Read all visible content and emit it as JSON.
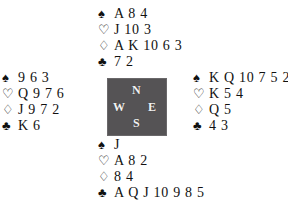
{
  "diagram": {
    "type": "bridge-deal-diagram",
    "background_color": "#ffffff",
    "text_color": "#111111"
  },
  "suits": {
    "spade": {
      "name": "spade-suit-symbol",
      "glyph": "♠",
      "filled": true
    },
    "heart": {
      "name": "heart-suit-symbol",
      "glyph": "♡",
      "filled": false
    },
    "diamond": {
      "name": "diamond-suit-symbol",
      "glyph": "♢",
      "filled": false
    },
    "club": {
      "name": "club-suit-symbol",
      "glyph": "♣",
      "filled": true
    }
  },
  "compass": {
    "box_color": "#555355",
    "label_color": "#f2f2f2",
    "north": "N",
    "west": "W",
    "east": "E",
    "south": "S"
  },
  "hands": {
    "north": {
      "position": "North",
      "spades": "A 8 4",
      "hearts": "J 10 3",
      "diamonds": "A K 10 6 3",
      "clubs": "7 2"
    },
    "west": {
      "position": "West",
      "spades": "9 6 3",
      "hearts": "Q 9 7 6",
      "diamonds": "J 9 7 2",
      "clubs": "K 6"
    },
    "east": {
      "position": "East",
      "spades": "K Q 10 7 5 2",
      "hearts": "K 5 4",
      "diamonds": "Q 5",
      "clubs": "4 3"
    },
    "south": {
      "position": "South",
      "spades": "J",
      "hearts": "A 8 2",
      "diamonds": "8 4",
      "clubs": "A Q J 10 9 8 5"
    }
  }
}
